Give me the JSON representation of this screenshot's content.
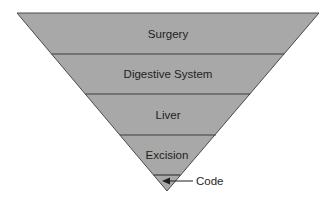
{
  "diagram": {
    "type": "inverted-pyramid",
    "levels": [
      {
        "label": "Surgery"
      },
      {
        "label": "Digestive System"
      },
      {
        "label": "Liver"
      },
      {
        "label": "Excision"
      },
      {
        "label": ""
      }
    ],
    "callout": {
      "label": "Code",
      "target_level": 4
    },
    "colors": {
      "fill": "#a8a8a8",
      "stroke": "#4a4a4a",
      "text": "#1e1e1e",
      "background": "#ffffff"
    }
  }
}
